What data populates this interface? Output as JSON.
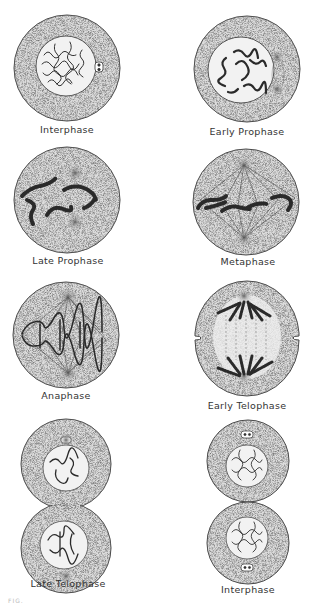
{
  "figure": {
    "caption_fragment": "FIG.",
    "colors": {
      "ink": "#2a2a2a",
      "cytoplasm": "#d9d9d9",
      "nucleus": "#f4f4f4",
      "background": "#ffffff"
    },
    "stages": [
      {
        "id": "interphase-1",
        "label": "Interphase"
      },
      {
        "id": "early-prophase",
        "label": "Early Prophase"
      },
      {
        "id": "late-prophase",
        "label": "Late Prophase"
      },
      {
        "id": "metaphase",
        "label": "Metaphase"
      },
      {
        "id": "anaphase",
        "label": "Anaphase"
      },
      {
        "id": "early-telophase",
        "label": "Early Telophase"
      },
      {
        "id": "late-telophase",
        "label": "Late Telophase"
      },
      {
        "id": "interphase-2",
        "label": "Interphase"
      }
    ]
  }
}
